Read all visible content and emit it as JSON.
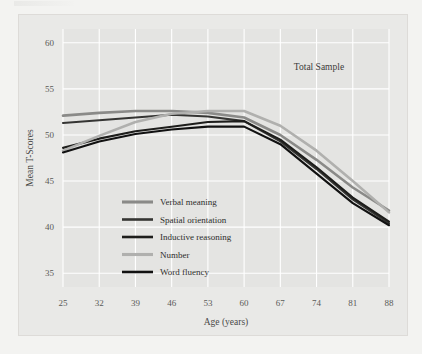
{
  "chart_data": {
    "type": "line",
    "title": "",
    "annotation": "Total Sample",
    "xlabel": "Age (years)",
    "ylabel": "Mean T-Scores",
    "x": [
      25,
      32,
      39,
      46,
      53,
      60,
      67,
      74,
      81,
      88
    ],
    "xticklabels": [
      "25",
      "32",
      "39",
      "46",
      "53",
      "60",
      "67",
      "74",
      "81",
      "88"
    ],
    "yticks": [
      35,
      40,
      45,
      50,
      55,
      60
    ],
    "yticklabels": [
      "35",
      "40",
      "45",
      "50",
      "55",
      "60"
    ],
    "xlim": [
      25,
      88
    ],
    "ylim": [
      33.5,
      61.5
    ],
    "grid": true,
    "legend_position": "inside-lower-left",
    "series": [
      {
        "name": "Verbal meaning",
        "color": "#8a8a88",
        "width": 2.6,
        "values": [
          52.1,
          52.4,
          52.6,
          52.6,
          52.4,
          51.9,
          50.0,
          47.3,
          44.3,
          41.8
        ]
      },
      {
        "name": "Spatial orientation",
        "color": "#353533",
        "width": 2.1,
        "values": [
          51.3,
          51.6,
          51.9,
          52.2,
          52.0,
          51.5,
          49.3,
          46.3,
          43.0,
          40.4
        ]
      },
      {
        "name": "Inductive reasoning",
        "color": "#1d1d1b",
        "width": 2.1,
        "values": [
          48.6,
          49.6,
          50.4,
          50.9,
          51.4,
          51.5,
          49.5,
          46.5,
          43.2,
          40.6
        ]
      },
      {
        "name": "Number",
        "color": "#b0b0ae",
        "width": 2.6,
        "values": [
          48.3,
          49.9,
          51.4,
          52.3,
          52.6,
          52.6,
          51.0,
          48.3,
          45.0,
          41.6
        ]
      },
      {
        "name": "Word fluency",
        "color": "#111111",
        "width": 2.1,
        "values": [
          48.1,
          49.3,
          50.1,
          50.6,
          50.9,
          50.9,
          49.0,
          45.8,
          42.6,
          40.2
        ]
      }
    ]
  },
  "legend": {
    "items": [
      {
        "label": "Verbal meaning"
      },
      {
        "label": "Spatial orientation"
      },
      {
        "label": "Inductive reasoning"
      },
      {
        "label": "Number"
      },
      {
        "label": "Word fluency"
      }
    ]
  }
}
